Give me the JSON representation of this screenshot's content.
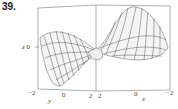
{
  "exercise_number": "39.",
  "plot": {
    "type": "3d-surface-wireframe",
    "axes": {
      "z": {
        "label": "z",
        "ticks": [
          "0"
        ]
      },
      "y": {
        "label": "y",
        "ticks": [
          "−2",
          "0",
          "2"
        ]
      },
      "x": {
        "label": "x",
        "ticks": [
          "2",
          "0",
          "−2"
        ]
      }
    }
  }
}
